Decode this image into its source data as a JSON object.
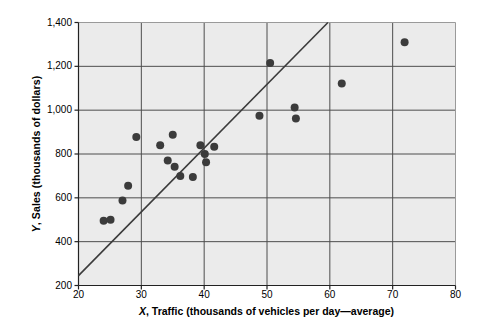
{
  "chart_data": {
    "type": "scatter",
    "title": "",
    "xlabel": "X, Traffic (thousands of vehicles per day—average)",
    "xlabel_italic": "X",
    "xlabel_rest": ", Traffic (thousands of vehicles per day—average)",
    "ylabel": "Y, Sales (thousands of dollars)",
    "ylabel_italic": "Y",
    "ylabel_rest": ", Sales (thousands of dollars)",
    "xlim": [
      20,
      80
    ],
    "ylim": [
      200,
      1400
    ],
    "xticks": [
      20,
      30,
      40,
      50,
      60,
      70,
      80
    ],
    "xtick_labels": [
      "20",
      "30",
      "40",
      "50",
      "60",
      "70",
      "80"
    ],
    "yticks": [
      200,
      400,
      600,
      800,
      1000,
      1200,
      1400
    ],
    "ytick_labels": [
      "200",
      "400",
      "600",
      "800",
      "1,000",
      "1,200",
      "1,400"
    ],
    "grid": true,
    "grid_color": "#4d4d4d",
    "plot_background": "#ebebeb",
    "marker_color": "#3b3b3b",
    "marker_size": 4,
    "legend": null,
    "points": [
      {
        "x": 24.0,
        "y": 495
      },
      {
        "x": 25.1,
        "y": 500
      },
      {
        "x": 27.0,
        "y": 588
      },
      {
        "x": 27.9,
        "y": 655
      },
      {
        "x": 29.2,
        "y": 878
      },
      {
        "x": 33.0,
        "y": 840
      },
      {
        "x": 34.2,
        "y": 770
      },
      {
        "x": 35.0,
        "y": 888
      },
      {
        "x": 35.3,
        "y": 742
      },
      {
        "x": 36.2,
        "y": 700
      },
      {
        "x": 38.2,
        "y": 695
      },
      {
        "x": 39.4,
        "y": 840
      },
      {
        "x": 40.1,
        "y": 800
      },
      {
        "x": 40.3,
        "y": 762
      },
      {
        "x": 41.6,
        "y": 833
      },
      {
        "x": 48.8,
        "y": 975
      },
      {
        "x": 50.5,
        "y": 1215
      },
      {
        "x": 54.4,
        "y": 1012
      },
      {
        "x": 54.6,
        "y": 962
      },
      {
        "x": 61.9,
        "y": 1122
      },
      {
        "x": 71.9,
        "y": 1310
      }
    ],
    "trendline": {
      "type": "line",
      "color": "#3b3b3b",
      "x_start": 20.0,
      "y_start": 245,
      "x_end": 59.7,
      "y_end": 1400
    }
  }
}
